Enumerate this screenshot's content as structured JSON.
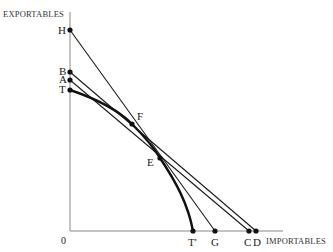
{
  "axes": {
    "y_label": "EXPORTABLES",
    "x_label": "IMPORTABLES",
    "origin_label": "0",
    "origin": {
      "x": 70,
      "y": 231
    },
    "x_end": 333,
    "y_top": 12,
    "axis_color": "#888888"
  },
  "points": [
    {
      "id": "H",
      "label": "H",
      "x": 70,
      "y": 30
    },
    {
      "id": "B",
      "label": "B",
      "x": 70,
      "y": 72
    },
    {
      "id": "A",
      "label": "A",
      "x": 70,
      "y": 80
    },
    {
      "id": "T",
      "label": "T",
      "x": 70,
      "y": 90
    },
    {
      "id": "F",
      "label": "F",
      "x": 132,
      "y": 124
    },
    {
      "id": "E",
      "label": "E",
      "x": 160,
      "y": 158
    },
    {
      "id": "T2",
      "label": "T'",
      "x": 193,
      "y": 231
    },
    {
      "id": "G",
      "label": "G",
      "x": 215,
      "y": 231
    },
    {
      "id": "C",
      "label": "C",
      "x": 249,
      "y": 231
    },
    {
      "id": "D",
      "label": "D",
      "x": 256,
      "y": 231
    }
  ],
  "lines": [
    {
      "from": "H",
      "to": "G"
    },
    {
      "from": "B",
      "to": "D"
    },
    {
      "from": "A",
      "to": "C"
    }
  ],
  "curve": {
    "name": "transformation curve",
    "from": "T",
    "through": [
      "F",
      "E"
    ],
    "to": "T2"
  },
  "colors": {
    "line": "#1a1a1a",
    "curve": "#111111",
    "axis": "#888888"
  }
}
